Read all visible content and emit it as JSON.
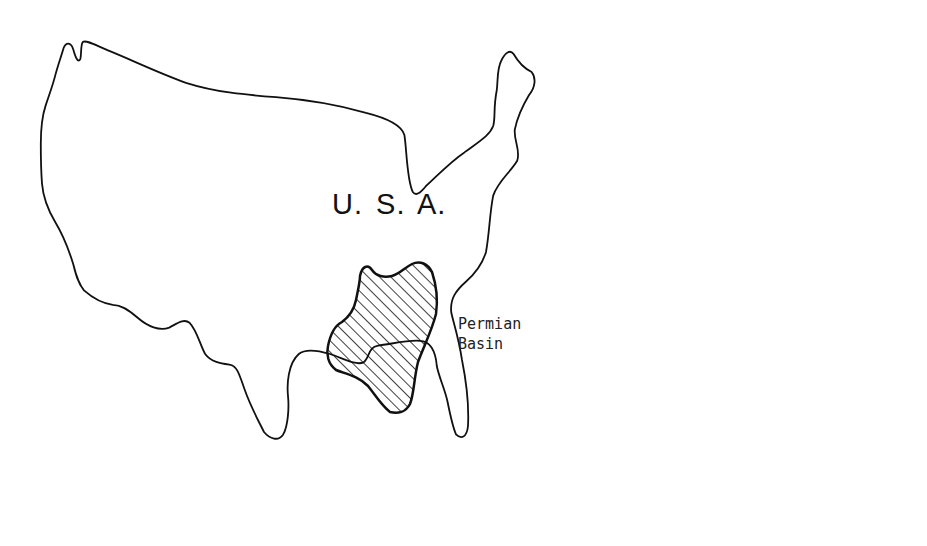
{
  "map": {
    "country_label": "U. S. A.",
    "region_label_line1": "Permian",
    "region_label_line2": "Basin",
    "outline_color": "#111111",
    "hatch_color": "#111111",
    "background_color": "#ffffff"
  }
}
